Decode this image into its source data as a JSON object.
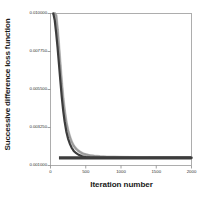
{
  "chart_data": {
    "type": "line",
    "title": "",
    "xlabel": "Iteration number",
    "ylabel": "Successive difference loss function",
    "xlim": [
      0,
      2000
    ],
    "ylim": [
      0.001,
      0.01
    ],
    "grid": false,
    "legend": "none",
    "xticks": [
      0,
      500,
      1000,
      1500,
      2000
    ],
    "xtick_labels": [
      "0",
      "500",
      "1000",
      "1500",
      "2000"
    ],
    "yticks": [
      0.001,
      0.00325,
      0.0055,
      0.00775,
      0.01
    ],
    "ytick_labels": [
      "0.001000",
      "0.003250",
      "0.005500",
      "0.007750",
      "0.010000"
    ],
    "series": [
      {
        "name": "upper-band",
        "color": "#9a9a9a",
        "style": "dense-markers",
        "x": [
          40,
          60,
          80,
          100,
          120,
          140,
          160,
          180,
          200,
          225,
          250,
          275,
          300,
          330,
          360,
          400,
          450,
          500,
          560,
          620,
          700,
          800,
          900,
          1000,
          1200,
          1400,
          1600,
          1800,
          2000
        ],
        "values": [
          0.01,
          0.01,
          0.00988,
          0.00905,
          0.008,
          0.0069,
          0.00585,
          0.00495,
          0.00425,
          0.00355,
          0.00305,
          0.00268,
          0.0024,
          0.00216,
          0.002,
          0.00185,
          0.00172,
          0.00165,
          0.00159,
          0.00156,
          0.00153,
          0.00151,
          0.0015,
          0.00149,
          0.00148,
          0.00148,
          0.00147,
          0.00147,
          0.00147
        ]
      },
      {
        "name": "lower-line",
        "color": "#3c3c3c",
        "style": "solid",
        "x": [
          40,
          60,
          80,
          100,
          120,
          140,
          160,
          180,
          200,
          225,
          250,
          275,
          300,
          330,
          360,
          400,
          450,
          500,
          560,
          620,
          700,
          800,
          900,
          1000,
          1200,
          1400,
          1600,
          1800,
          2000
        ],
        "values": [
          0.01,
          0.0096,
          0.00885,
          0.008,
          0.007,
          0.006,
          0.00505,
          0.00425,
          0.00362,
          0.003,
          0.00258,
          0.00228,
          0.00205,
          0.00186,
          0.00174,
          0.00163,
          0.00154,
          0.0015,
          0.00147,
          0.00146,
          0.00145,
          0.00145,
          0.00145,
          0.00145,
          0.00145,
          0.00145,
          0.00145,
          0.00145,
          0.00145
        ]
      }
    ],
    "plateau_value": 0.00145,
    "colors": {
      "axis": "#8c8c8c",
      "text": "#1a1a1a",
      "band": "#9a9a9a",
      "line": "#3c3c3c",
      "background": "#ffffff"
    }
  }
}
